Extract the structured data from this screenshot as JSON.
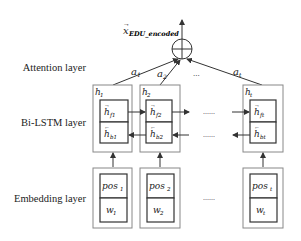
{
  "layers": {
    "attention": "Attention layer",
    "bilstm": "Bi-LSTM layer",
    "embedding": "Embedding layer"
  },
  "output": {
    "symbol": "x",
    "subscript": "EDU_encoded",
    "operator": "⊕"
  },
  "attention_weights": [
    {
      "symbol": "a",
      "sub": "1"
    },
    {
      "symbol": "a",
      "sub": "2"
    },
    {
      "symbol": "a",
      "sub": "t"
    }
  ],
  "attention_ellipsis": "...",
  "hidden_states": [
    {
      "h": "h",
      "h_sub": "1",
      "f_sub": "f1",
      "b_sub": "b1"
    },
    {
      "h": "h",
      "h_sub": "2",
      "f_sub": "f2",
      "b_sub": "b2"
    },
    {
      "h": "h",
      "h_sub": "t",
      "f_sub": "ft",
      "b_sub": "bt"
    }
  ],
  "embeddings": [
    {
      "pos": "pos",
      "pos_sub": "1",
      "w": "w",
      "w_sub": "1"
    },
    {
      "pos": "pos",
      "pos_sub": "2",
      "w": "w",
      "w_sub": "2"
    },
    {
      "pos": "pos",
      "pos_sub": "t",
      "w": "w",
      "w_sub": "t"
    }
  ],
  "ellipsis": "......",
  "colors": {
    "outer_box": "#888888",
    "inner_box": "#333333",
    "line": "#333333"
  }
}
